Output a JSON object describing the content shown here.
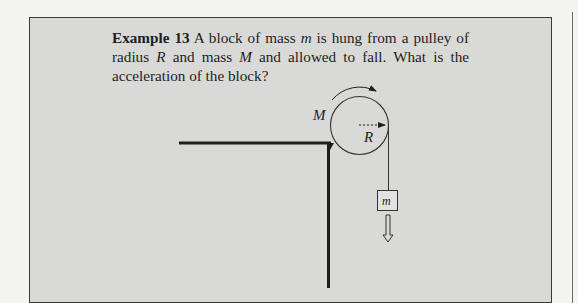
{
  "example": {
    "label": "Example 13",
    "text_part1": " A block of mass ",
    "var_m": "m",
    "text_part2": " is hung from a pulley of radius ",
    "var_R": "R",
    "text_part3": " and mass ",
    "var_M": "M",
    "text_part4": " and allowed to fall. What is the acceleration of the block?"
  },
  "diagram": {
    "pulley_mass_label": "M",
    "radius_label": "R",
    "block_label": "m",
    "colors": {
      "box_background": "#d9d9d7",
      "line": "#1e1e1e"
    }
  }
}
